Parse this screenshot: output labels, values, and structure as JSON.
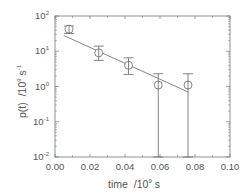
{
  "chart_data": {
    "type": "scatter",
    "title": "",
    "xlabel": "time /10^9 s",
    "ylabel": "p(t) /10^9 s^-1",
    "xscale": "linear",
    "yscale": "log",
    "xlim": [
      0.0,
      0.1
    ],
    "ylim": [
      0.01,
      100
    ],
    "x_ticks": [
      "0.00",
      "0.02",
      "0.04",
      "0.06",
      "0.08",
      "0.10"
    ],
    "y_ticks": [
      "10^-2",
      "10^-1",
      "10^0",
      "10^1",
      "10^2"
    ],
    "grid": false,
    "legend": null,
    "series": [
      {
        "name": "measured",
        "marker": "open-circle",
        "x": [
          0.008,
          0.025,
          0.042,
          0.059,
          0.076
        ],
        "y": [
          42,
          9,
          4,
          1.1,
          1.1
        ],
        "y_err_low": [
          32,
          5.5,
          2.2,
          0.01,
          0.01
        ],
        "y_err_high": [
          52,
          14,
          6.5,
          2.3,
          2.3
        ]
      },
      {
        "name": "fit",
        "type": "line",
        "x": [
          0.005,
          0.076
        ],
        "y": [
          28,
          0.7
        ]
      }
    ]
  },
  "labels": {
    "x_axis": "time",
    "x_unit": "/10",
    "x_unit_exp": "9",
    "x_unit_tail": " s",
    "y_axis": "p(t)",
    "y_unit": "/10",
    "y_unit_exp": "9",
    "y_unit_tail": " s",
    "y_unit_tail_exp": "-1"
  },
  "ticks": {
    "x": [
      "0.00",
      "0.02",
      "0.04",
      "0.06",
      "0.08",
      "0.10"
    ],
    "y_base": "10",
    "y_exp": [
      "2",
      "1",
      "0",
      "-1",
      "-2"
    ]
  }
}
